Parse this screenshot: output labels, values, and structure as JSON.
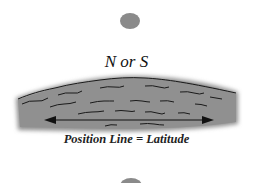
{
  "labels": {
    "hemisphere": "N or S",
    "position_line": "Position Line = Latitude"
  },
  "colors": {
    "body": "#8a8a8a",
    "horizon_fill": "#8f8f8f",
    "wave_stroke": "#1a1a1a",
    "arrow": "#111111"
  }
}
